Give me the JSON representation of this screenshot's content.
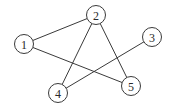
{
  "graph": {
    "nodes": [
      {
        "id": "1",
        "label": "1",
        "x": 24,
        "y": 44,
        "r": 9.5
      },
      {
        "id": "2",
        "label": "2",
        "x": 96,
        "y": 15,
        "r": 9.5
      },
      {
        "id": "3",
        "label": "3",
        "x": 152,
        "y": 37,
        "r": 9.5
      },
      {
        "id": "4",
        "label": "4",
        "x": 58,
        "y": 93,
        "r": 9.5
      },
      {
        "id": "5",
        "label": "5",
        "x": 131,
        "y": 86,
        "r": 9.5
      }
    ],
    "edges": [
      {
        "from": "1",
        "to": "2"
      },
      {
        "from": "1",
        "to": "5"
      },
      {
        "from": "2",
        "to": "4"
      },
      {
        "from": "2",
        "to": "5"
      },
      {
        "from": "3",
        "to": "4"
      }
    ]
  }
}
